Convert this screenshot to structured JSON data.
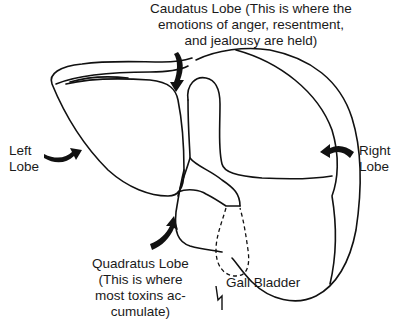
{
  "diagram": {
    "labels": {
      "caudatus": {
        "text": "Caudatus Lobe (This is where the\nemotions of anger, resentment,\nand jealousy are held)"
      },
      "left": {
        "text": "Left\nLobe"
      },
      "right": {
        "text": "Right\nLobe"
      },
      "quadratus": {
        "text": "Quadratus Lobe\n(This is where\nmost toxins ac-\ncumulate)"
      },
      "gall_bladder": {
        "text": "Gall Bladder"
      }
    },
    "colors": {
      "line": "#111111",
      "background": "#ffffff"
    }
  }
}
